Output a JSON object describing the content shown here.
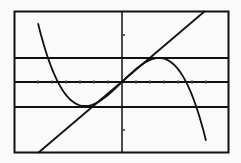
{
  "chart_data": {
    "type": "line",
    "title": "",
    "xlabel": "",
    "ylabel": "",
    "grid": false,
    "legend": "none",
    "xlim": [
      -4.4,
      4.4
    ],
    "ylim": [
      -3,
      3
    ],
    "x_tick_spacing": 0.57,
    "y_ticks_marked": [
      -2,
      2
    ],
    "horizontal_lines": [
      1,
      -1
    ],
    "series": [
      {
        "name": "cubic",
        "equation": "y = (x^3 - 3x)/2 scaled; local max (-1.5, 1), local min (1.5, -1)",
        "points": [
          {
            "x": -3.45,
            "y": -3.0
          },
          {
            "x": -2.8,
            "y": -1.0
          },
          {
            "x": -2.4,
            "y": 0.3
          },
          {
            "x": -1.5,
            "y": 1.0
          },
          {
            "x": -0.8,
            "y": 0.65
          },
          {
            "x": 0,
            "y": 0
          },
          {
            "x": 0.8,
            "y": -0.65
          },
          {
            "x": 1.5,
            "y": -1.0
          },
          {
            "x": 2.4,
            "y": -0.3
          },
          {
            "x": 2.8,
            "y": 1.0
          },
          {
            "x": 3.4,
            "y": 3.0
          }
        ]
      },
      {
        "name": "line",
        "equation": "y = 0.87x",
        "points": [
          {
            "x": -3.45,
            "y": -3.0
          },
          {
            "x": 0,
            "y": 0
          },
          {
            "x": 3.4,
            "y": 3.0
          }
        ]
      }
    ]
  },
  "colors": {
    "background": "#fafafa",
    "stroke": "#111111"
  }
}
